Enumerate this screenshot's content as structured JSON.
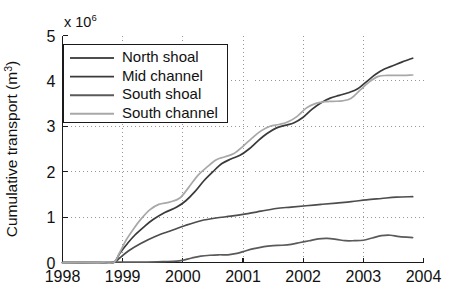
{
  "figure": {
    "background_color": "#ffffff",
    "axis_color": "#1a1a1a",
    "grid_color": "#8c8c8c"
  },
  "chart_data": {
    "type": "line",
    "title": "",
    "subtitle": "",
    "xlabel": "",
    "ylabel": "Cumulative transport (m3)",
    "ylabel_base": "Cumulative transport (m",
    "ylabel_unit_sup": "3",
    "ylabel_close": ")",
    "y_exponent_prefix": "x 10",
    "y_exponent_power": "6",
    "y_scale_note": "x 10^6",
    "xlim": [
      1998,
      2004
    ],
    "ylim": [
      0,
      5
    ],
    "xticks": [
      1998,
      1999,
      2000,
      2001,
      2002,
      2003,
      2004
    ],
    "xtick_labels": [
      "1998",
      "1999",
      "2000",
      "2001",
      "2002",
      "2003",
      "2004"
    ],
    "yticks": [
      0,
      1,
      2,
      3,
      4,
      5
    ],
    "ytick_labels": [
      "0",
      "1",
      "2",
      "3",
      "4",
      "5"
    ],
    "grid": true,
    "grid_style": "dotted",
    "legend_position": "upper left",
    "series": [
      {
        "name": "North shoal",
        "color": "#4d4d4d",
        "x": [
          1998.0,
          1998.6,
          1998.85,
          1998.95,
          1999.1,
          1999.3,
          1999.55,
          1999.8,
          2000.05,
          2000.3,
          2000.55,
          2000.8,
          2001.05,
          2001.3,
          2001.55,
          2001.8,
          2002.05,
          2002.3,
          2002.55,
          2002.8,
          2003.05,
          2003.3,
          2003.55,
          2003.82
        ],
        "y": [
          0.0,
          0.0,
          0.0,
          0.1,
          0.26,
          0.42,
          0.58,
          0.7,
          0.82,
          0.92,
          0.98,
          1.02,
          1.07,
          1.13,
          1.19,
          1.22,
          1.25,
          1.28,
          1.31,
          1.34,
          1.38,
          1.41,
          1.44,
          1.45
        ]
      },
      {
        "name": "Mid channel",
        "color": "#3a3a3a",
        "x": [
          1998.0,
          1998.6,
          1998.85,
          1998.95,
          1999.08,
          1999.2,
          1999.35,
          1999.5,
          1999.7,
          1999.9,
          2000.05,
          2000.2,
          2000.35,
          2000.5,
          2000.65,
          2000.8,
          2000.95,
          2001.1,
          2001.25,
          2001.4,
          2001.55,
          2001.7,
          2001.85,
          2002.0,
          2002.15,
          2002.3,
          2002.45,
          2002.6,
          2002.75,
          2002.9,
          2003.05,
          2003.2,
          2003.35,
          2003.5,
          2003.65,
          2003.82
        ],
        "y": [
          0.0,
          0.0,
          0.0,
          0.2,
          0.42,
          0.6,
          0.78,
          0.94,
          1.1,
          1.22,
          1.36,
          1.56,
          1.8,
          2.0,
          2.18,
          2.28,
          2.36,
          2.5,
          2.68,
          2.84,
          2.96,
          3.02,
          3.08,
          3.2,
          3.38,
          3.52,
          3.62,
          3.68,
          3.74,
          3.82,
          3.98,
          4.14,
          4.26,
          4.34,
          4.42,
          4.5
        ]
      },
      {
        "name": "South shoal",
        "color": "#5a5a5a",
        "x": [
          1998.0,
          1998.6,
          1998.85,
          1999.1,
          1999.4,
          1999.7,
          1999.9,
          2000.0,
          2000.15,
          2000.3,
          2000.45,
          2000.6,
          2000.75,
          2000.9,
          2001.05,
          2001.2,
          2001.35,
          2001.5,
          2001.65,
          2001.8,
          2001.95,
          2002.1,
          2002.25,
          2002.4,
          2002.55,
          2002.7,
          2002.85,
          2003.0,
          2003.15,
          2003.3,
          2003.45,
          2003.6,
          2003.82
        ],
        "y": [
          0.0,
          0.0,
          0.01,
          0.01,
          0.01,
          0.02,
          0.03,
          0.05,
          0.1,
          0.14,
          0.16,
          0.17,
          0.17,
          0.2,
          0.26,
          0.31,
          0.35,
          0.37,
          0.38,
          0.4,
          0.44,
          0.48,
          0.52,
          0.53,
          0.51,
          0.48,
          0.48,
          0.49,
          0.54,
          0.59,
          0.6,
          0.57,
          0.55
        ]
      },
      {
        "name": "South channel",
        "color": "#a8a8a8",
        "x": [
          1998.0,
          1998.6,
          1998.85,
          1998.95,
          1999.06,
          1999.18,
          1999.3,
          1999.45,
          1999.6,
          1999.78,
          1999.95,
          2000.1,
          2000.25,
          2000.4,
          2000.55,
          2000.7,
          2000.85,
          2001.0,
          2001.15,
          2001.3,
          2001.45,
          2001.6,
          2001.75,
          2001.9,
          2002.05,
          2002.2,
          2002.35,
          2002.5,
          2002.65,
          2002.8,
          2002.95,
          2003.1,
          2003.25,
          2003.4,
          2003.6,
          2003.82
        ],
        "y": [
          0.0,
          0.0,
          0.0,
          0.22,
          0.5,
          0.74,
          0.95,
          1.16,
          1.28,
          1.33,
          1.42,
          1.66,
          1.92,
          2.1,
          2.26,
          2.33,
          2.4,
          2.56,
          2.74,
          2.9,
          3.0,
          3.04,
          3.1,
          3.22,
          3.4,
          3.5,
          3.54,
          3.55,
          3.56,
          3.62,
          3.8,
          3.98,
          4.1,
          4.12,
          4.12,
          4.13
        ]
      }
    ]
  },
  "legend": {
    "items": [
      {
        "label": "North shoal",
        "color": "#4d4d4d"
      },
      {
        "label": "Mid channel",
        "color": "#3a3a3a"
      },
      {
        "label": "South shoal",
        "color": "#5a5a5a"
      },
      {
        "label": "South channel",
        "color": "#a8a8a8"
      }
    ]
  }
}
